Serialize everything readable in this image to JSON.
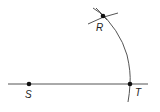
{
  "diagram": {
    "points": [
      {
        "id": "S",
        "label": "S"
      },
      {
        "id": "T",
        "label": "T"
      },
      {
        "id": "R",
        "label": "R"
      }
    ],
    "colors": {
      "line": "#555555",
      "point": "#111111",
      "label": "#222222"
    }
  }
}
